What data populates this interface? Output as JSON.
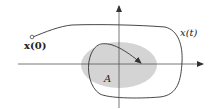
{
  "diagram": {
    "labels": {
      "initial_state": "x(0)",
      "trajectory": "x(t)",
      "region": "A"
    },
    "colors": {
      "region_fill": "#d4d4d4",
      "stroke": "#333333",
      "axis": "#555555"
    }
  }
}
